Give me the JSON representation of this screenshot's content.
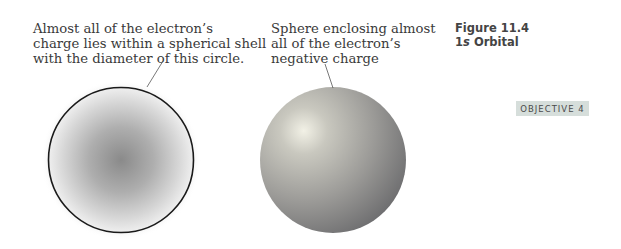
{
  "figure": {
    "number_label": "Figure 11.4",
    "title_prefix": "1",
    "title_italic": "s",
    "title_suffix": " Orbital"
  },
  "objective_badge": "OBJECTIVE 4",
  "captions": {
    "left": "Almost all of the electron’s\ncharge lies within a spherical shell\nwith the diameter of this circle.",
    "right": "Sphere enclosing almost\nall of the electron’s\nnegative charge"
  },
  "illustrations": {
    "left": "cross-section of 1s orbital electron cloud with boundary circle",
    "right": "shaded sphere enclosing 1s orbital"
  },
  "colors": {
    "badge_bg": "#d6dedb",
    "outline": "#1a1a1a",
    "cloud_center": "#8a8a8a",
    "sphere_highlight": "#f2f1e6",
    "sphere_shadow": "#6f6f6f"
  }
}
